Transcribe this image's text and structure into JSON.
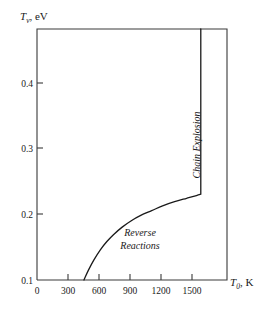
{
  "figure": {
    "name": "vibrational-temperature-vs-gas-temperature-plot",
    "background_color": "#ffffff",
    "line_color": "#1a1a1a",
    "frame_color": "#3a3a3a"
  },
  "chart_data": {
    "type": "line",
    "title": "",
    "subtitle": "",
    "xlabel": "T₀, K",
    "xlabel_symbol": "T",
    "xlabel_subscript": "0",
    "xlabel_unit": ", K",
    "ylabel": "Tᵥ, eV",
    "ylabel_symbol": "T",
    "ylabel_subscript": "v",
    "ylabel_unit": ", eV",
    "xlim": [
      0,
      1740
    ],
    "ylim": [
      0.1,
      0.4655
    ],
    "xticks": [
      0,
      300,
      600,
      900,
      1200,
      1500
    ],
    "xtick_labels": [
      "0",
      "300",
      "600",
      "900",
      "1200",
      "1500"
    ],
    "yticks": [
      0.1,
      0.2,
      0.3,
      0.4
    ],
    "ytick_labels": [
      "0.1",
      "0.2",
      "0.3",
      "0.4"
    ],
    "grid": false,
    "legend": false,
    "legend_position": "none",
    "series": [
      {
        "name": "reverse-reactions-boundary",
        "comment": "rising branch then vertical chain-explosion threshold at 1500 K",
        "x": [
          430,
          470,
          520,
          580,
          640,
          700,
          780,
          860,
          950,
          1050,
          1150,
          1260,
          1370,
          1460,
          1500,
          1500
        ],
        "y": [
          0.1,
          0.114,
          0.129,
          0.144,
          0.156,
          0.166,
          0.177,
          0.186,
          0.194,
          0.201,
          0.208,
          0.214,
          0.219,
          0.223,
          0.225,
          0.4655
        ]
      }
    ],
    "annotations": [
      {
        "name": "chain-explosion-label",
        "text": "Chain Explosion",
        "x": 1560,
        "y": 0.31,
        "rotation": -90,
        "style": "italic"
      },
      {
        "name": "reverse-reactions-label",
        "line1": "Reverse",
        "line2": "Reactions",
        "x": 1000,
        "y": 0.163,
        "rotation": 0,
        "style": "italic"
      }
    ]
  }
}
